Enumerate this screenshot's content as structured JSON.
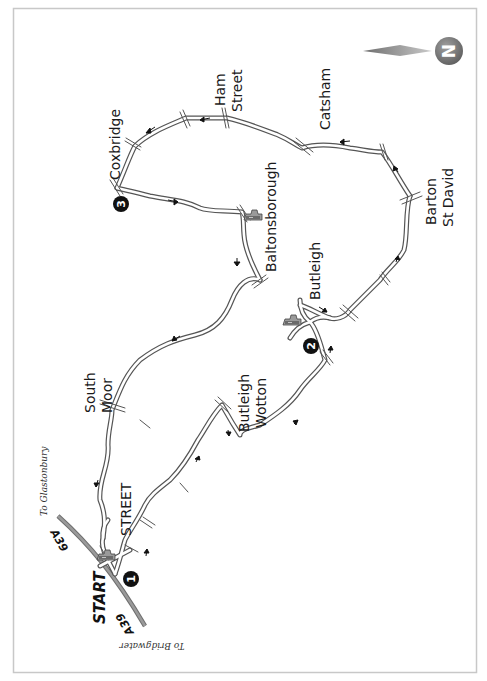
{
  "map": {
    "type": "route map",
    "orientation": "rotated, north points to right",
    "compass": {
      "label": "N",
      "colors": {
        "needle": "#9a9a9a",
        "circle": "#7d7d7d"
      }
    },
    "start_label": "START",
    "road_labels": {
      "a39_top": "A39",
      "a39_bottom": "A39"
    },
    "directions": {
      "glastonbury": "To Glastonbury",
      "bridgwater": "To Bridgwater"
    },
    "places": {
      "coxbridge": "Coxbridge",
      "ham_street_1": "Ham",
      "ham_street_2": "Street",
      "catsham": "Catsham",
      "barton_1": "Barton",
      "barton_2": "St David",
      "baltonsborough": "Baltonsborough",
      "butleigh": "Butleigh",
      "south_moor_1": "South",
      "south_moor_2": "Moor",
      "butleigh_wotton_1": "Butleigh",
      "butleigh_wotton_2": "Wotton",
      "street": "STREET"
    },
    "waypoints": [
      {
        "number": "1"
      },
      {
        "number": "2"
      },
      {
        "number": "3"
      }
    ],
    "pub_icons": [
      "street",
      "baltonsborough",
      "butleigh"
    ],
    "colors": {
      "frame": "#c8c8c8",
      "road_outline": "#555555",
      "main_road": "#808080",
      "marker": "#111111"
    }
  }
}
